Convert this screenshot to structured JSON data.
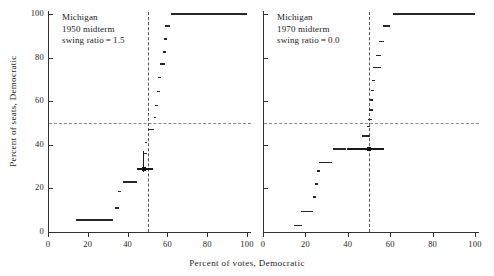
{
  "figure": {
    "xlabel": "Percent  of  votes, Democratic",
    "ylabel": "Percent of seats, Democratic"
  },
  "panels": [
    {
      "id": "left",
      "annotation": {
        "line1": "Michigan",
        "line2": "1950 midterm",
        "line3": "swing ratio = 1.5"
      }
    },
    {
      "id": "right",
      "annotation": {
        "line1": "Michigan",
        "line2": "1970 midterm",
        "line3": "swing ratio = 0.0"
      }
    }
  ],
  "axis": {
    "x_ticks": [
      0,
      20,
      40,
      60,
      80,
      100
    ],
    "x_tick_labels": [
      "0",
      "20",
      "40",
      "60",
      "80",
      "100"
    ],
    "y_ticks": [
      0,
      20,
      40,
      60,
      80,
      100
    ],
    "y_tick_labels": [
      "0",
      "20",
      "40",
      "60",
      "80",
      "100"
    ],
    "xlim": [
      0,
      100
    ],
    "ylim": [
      0,
      100
    ]
  },
  "chart_data": {
    "type": "line",
    "title": "",
    "xlabel": "Percent  of  votes, Democratic",
    "ylabel": "Percent of seats, Democratic",
    "xlim": [
      0,
      100
    ],
    "ylim": [
      0,
      100
    ],
    "grid": false,
    "legend": null,
    "reference_lines": {
      "horizontal_seats_50": 50,
      "vertical_votes_50": 50,
      "style": "dashed"
    },
    "subplots": [
      {
        "name": "Michigan 1950 midterm",
        "swing_ratio": 1.5,
        "annotation_lines": [
          "Michigan",
          "1950 midterm",
          "swing ratio = 1.5"
        ],
        "observed_point": {
          "votes": 48.0,
          "seats": 29.0
        },
        "observed_horizontal_span": {
          "x0": 44.5,
          "x1": 53.0,
          "y": 29.0
        },
        "observed_vertical_span": {
          "x": 48.0,
          "y0": 27.5,
          "y1": 37.0
        },
        "step_segments": [
          {
            "x0": 14.0,
            "x1": 32.5,
            "y": 5.5
          },
          {
            "x0": 33.5,
            "x1": 35.5,
            "y": 11.0
          },
          {
            "x0": 35.0,
            "x1": 36.5,
            "y": 18.5
          },
          {
            "x0": 37.5,
            "x1": 44.5,
            "y": 23.0
          },
          {
            "x0": 45.0,
            "x1": 48.5,
            "y": 29.0
          },
          {
            "x0": 48.0,
            "x1": 49.5,
            "y": 36.0
          },
          {
            "x0": 48.5,
            "x1": 50.0,
            "y": 41.0
          },
          {
            "x0": 50.0,
            "x1": 53.5,
            "y": 47.0
          },
          {
            "x0": 53.5,
            "x1": 54.5,
            "y": 52.5
          },
          {
            "x0": 54.0,
            "x1": 55.5,
            "y": 58.0
          },
          {
            "x0": 55.0,
            "x1": 56.5,
            "y": 64.5
          },
          {
            "x0": 55.5,
            "x1": 57.0,
            "y": 71.0
          },
          {
            "x0": 56.5,
            "x1": 59.0,
            "y": 77.0
          },
          {
            "x0": 58.0,
            "x1": 59.5,
            "y": 82.5
          },
          {
            "x0": 58.5,
            "x1": 60.0,
            "y": 88.5
          },
          {
            "x0": 59.0,
            "x1": 61.5,
            "y": 94.5
          },
          {
            "x0": 62.0,
            "x1": 100.0,
            "y": 100.0
          }
        ]
      },
      {
        "name": "Michigan 1970 midterm",
        "swing_ratio": 0.0,
        "annotation_lines": [
          "Michigan",
          "1970 midterm",
          "swing ratio = 0.0"
        ],
        "observed_point": {
          "votes": 50.0,
          "seats": 38.0
        },
        "observed_horizontal_span": {
          "x0": 39.5,
          "x1": 57.0,
          "y": 38.0
        },
        "step_segments": [
          {
            "x0": 14.5,
            "x1": 18.5,
            "y": 3.0
          },
          {
            "x0": 18.0,
            "x1": 23.5,
            "y": 9.5
          },
          {
            "x0": 23.5,
            "x1": 25.0,
            "y": 16.0
          },
          {
            "x0": 24.5,
            "x1": 26.0,
            "y": 22.0
          },
          {
            "x0": 25.5,
            "x1": 27.0,
            "y": 28.0
          },
          {
            "x0": 26.5,
            "x1": 32.5,
            "y": 32.0
          },
          {
            "x0": 33.0,
            "x1": 39.0,
            "y": 38.0
          },
          {
            "x0": 46.5,
            "x1": 50.5,
            "y": 44.0
          },
          {
            "x0": 49.0,
            "x1": 50.5,
            "y": 48.5
          },
          {
            "x0": 49.5,
            "x1": 51.5,
            "y": 51.5
          },
          {
            "x0": 50.0,
            "x1": 52.0,
            "y": 56.0
          },
          {
            "x0": 50.5,
            "x1": 52.0,
            "y": 60.5
          },
          {
            "x0": 51.0,
            "x1": 52.5,
            "y": 65.0
          },
          {
            "x0": 51.5,
            "x1": 53.0,
            "y": 69.5
          },
          {
            "x0": 52.0,
            "x1": 55.5,
            "y": 75.5
          },
          {
            "x0": 53.5,
            "x1": 55.5,
            "y": 81.0
          },
          {
            "x0": 54.5,
            "x1": 57.0,
            "y": 87.5
          },
          {
            "x0": 56.5,
            "x1": 60.0,
            "y": 94.5
          },
          {
            "x0": 61.5,
            "x1": 100.0,
            "y": 100.0
          }
        ]
      }
    ]
  }
}
